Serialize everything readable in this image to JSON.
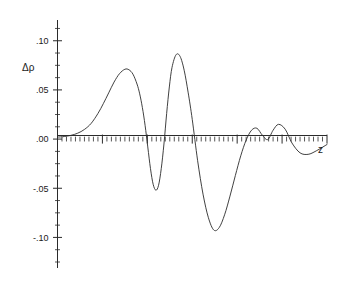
{
  "chart_data": {
    "type": "line",
    "title": "",
    "subtitle": "",
    "xlabel": "z",
    "ylabel": "Δρ",
    "grid": false,
    "legend": null,
    "xlim": [
      0,
      10
    ],
    "ylim": [
      -0.125,
      0.115
    ],
    "y_ticks": [
      {
        "value": 0.1,
        "label": ".10"
      },
      {
        "value": 0.05,
        "label": ".05"
      },
      {
        "value": 0.0,
        "label": ".00"
      },
      {
        "value": -0.05,
        "label": "-.05"
      },
      {
        "value": -0.1,
        "label": "-.10"
      }
    ],
    "y_minor_ticks_between_majors": 4,
    "x_ticks_unlabeled": true,
    "x_major_tick_count": 6,
    "x_minor_tick_count": 60,
    "series": [
      {
        "name": "Δρ(z)",
        "color": "#2b2b2b",
        "x": [
          0.0,
          0.25,
          0.5,
          0.75,
          1.0,
          1.25,
          1.5,
          1.7,
          1.9,
          2.1,
          2.3,
          2.5,
          2.65,
          2.8,
          2.95,
          3.05,
          3.15,
          3.25,
          3.35,
          3.45,
          3.55,
          3.65,
          3.75,
          3.85,
          3.95,
          4.05,
          4.15,
          4.25,
          4.4,
          4.55,
          4.7,
          4.85,
          5.0,
          5.2,
          5.4,
          5.6,
          5.8,
          6.0,
          6.2,
          6.4,
          6.6,
          6.8,
          7.0,
          7.2,
          7.4,
          7.6,
          7.8,
          8.0,
          8.2,
          8.45,
          8.7,
          9.0,
          9.3,
          9.6,
          10.0
        ],
        "y": [
          0.002,
          0.0026,
          0.0038,
          0.006,
          0.0098,
          0.016,
          0.026,
          0.036,
          0.047,
          0.058,
          0.0665,
          0.071,
          0.0705,
          0.066,
          0.056,
          0.046,
          0.032,
          0.014,
          -0.008,
          -0.03,
          -0.046,
          -0.052,
          -0.047,
          -0.03,
          -0.005,
          0.026,
          0.053,
          0.073,
          0.0858,
          0.084,
          0.07,
          0.047,
          0.02,
          -0.022,
          -0.056,
          -0.08,
          -0.0925,
          -0.09,
          -0.077,
          -0.058,
          -0.037,
          -0.017,
          -0.001,
          0.009,
          0.011,
          0.004,
          -0.0005,
          0.009,
          0.015,
          0.01,
          -0.004,
          -0.014,
          -0.0155,
          -0.012,
          -0.0055
        ],
        "annotations": [
          {
            "feature": "first positive peak",
            "x": 2.5,
            "y": 0.071
          },
          {
            "feature": "first negative trough",
            "x": 3.65,
            "y": -0.052
          },
          {
            "feature": "second positive peak (global max)",
            "x": 4.4,
            "y": 0.086
          },
          {
            "feature": "global minimum",
            "x": 5.8,
            "y": -0.0925
          },
          {
            "feature": "small bump one",
            "x": 7.35,
            "y": 0.011
          },
          {
            "feature": "small bump two",
            "x": 8.2,
            "y": 0.015
          },
          {
            "feature": "shallow tail dip",
            "x": 9.25,
            "y": -0.0155
          }
        ]
      }
    ]
  },
  "axes": {
    "y_axis_name": "Δρ",
    "x_axis_name": "z"
  }
}
